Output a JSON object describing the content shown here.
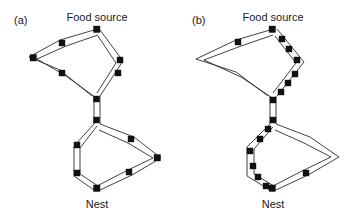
{
  "figure": {
    "background_color": "#ffffff",
    "line_color": "#2b2b2b",
    "node_color": "#111111",
    "text_color": "#1a1a1a"
  },
  "panels": [
    {
      "tag": "(a)",
      "tag_pos": {
        "x": 14,
        "y": 24
      },
      "food_label": "Food source",
      "food_label_pos": {
        "x": 97,
        "y": 18
      },
      "nest_label": "Nest",
      "nest_label_pos": {
        "x": 97,
        "y": 208
      },
      "description": "Symmetric trail: ants distributed evenly on both branches of upper and lower loops",
      "food_node": {
        "x": 97,
        "y": 29
      },
      "nest_node": {
        "x": 97,
        "y": 190
      },
      "junction_top": {
        "x": 97,
        "y": 98
      },
      "junction_bottom": {
        "x": 97,
        "y": 122
      },
      "upper_loop": {
        "left_vertex": {
          "x": 33,
          "y": 58
        },
        "left_branch_mid_upper": {
          "x": 63,
          "y": 43
        },
        "left_branch_mid_lower": {
          "x": 63,
          "y": 73
        },
        "right_vertex": {
          "x": 119,
          "y": 63
        }
      },
      "lower_loop": {
        "right_vertex": {
          "x": 158,
          "y": 158
        },
        "right_branch_mid_upper": {
          "x": 130,
          "y": 140
        },
        "right_branch_mid_lower": {
          "x": 130,
          "y": 172
        },
        "left_vertex": {
          "x": 76,
          "y": 152
        }
      },
      "node_count": 14
    },
    {
      "tag": "(b)",
      "tag_pos": {
        "x": 192,
        "y": 24
      },
      "food_label": "Food source",
      "food_label_pos": {
        "x": 273,
        "y": 18
      },
      "nest_label": "Nest",
      "nest_label_pos": {
        "x": 273,
        "y": 208
      },
      "description": "Asymmetric trail: ants concentrated on the short branch of each loop",
      "food_node": {
        "x": 273,
        "y": 29
      },
      "nest_node": {
        "x": 273,
        "y": 190
      },
      "junction_top": {
        "x": 273,
        "y": 98
      },
      "junction_bottom": {
        "x": 273,
        "y": 122
      },
      "upper_loop": {
        "left_vertex": {
          "x": 200,
          "y": 60
        },
        "left_branch_mid": {
          "x": 238,
          "y": 43
        },
        "right_vertex": {
          "x": 300,
          "y": 63
        }
      },
      "lower_loop": {
        "right_vertex": {
          "x": 336,
          "y": 157
        },
        "right_branch_mid": {
          "x": 305,
          "y": 172
        },
        "left_vertex": {
          "x": 250,
          "y": 152
        }
      },
      "node_count": 16
    }
  ],
  "labels": {
    "panel_a_tag": "(a)",
    "panel_b_tag": "(b)",
    "food_source": "Food source",
    "nest": "Nest"
  }
}
